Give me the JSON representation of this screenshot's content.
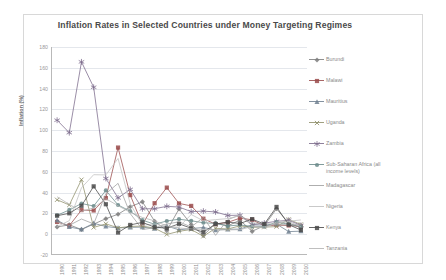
{
  "chart_data": {
    "type": "line",
    "title": "Inflation Rates in Selected Countries under Money Targeting Regimes",
    "xlabel": "",
    "ylabel": "Inflation (%)",
    "ylim": [
      -20,
      180
    ],
    "ytick_labels": [
      "180",
      "160",
      "140",
      "120",
      "100",
      "80",
      "60",
      "40",
      "20",
      "0",
      "-20"
    ],
    "ytick_values": [
      180,
      160,
      140,
      120,
      100,
      80,
      60,
      40,
      20,
      0,
      -20
    ],
    "grid": true,
    "legend_position": "right",
    "x": [
      1990,
      1991,
      1992,
      1993,
      1994,
      1995,
      1996,
      1997,
      1998,
      1999,
      2000,
      2001,
      2002,
      2003,
      2004,
      2005,
      2006,
      2007,
      2008,
      2009,
      2010
    ],
    "xtick_labels": [
      "1990",
      "1991",
      "1992",
      "1993",
      "1994",
      "1995",
      "1996",
      "1997",
      "1998",
      "1999",
      "2000",
      "2001",
      "2002",
      "2003",
      "2004",
      "2005",
      "2006",
      "2007",
      "2008",
      "2009",
      "2010"
    ],
    "series": [
      {
        "name": "Burundi",
        "color": "#7d7d7d",
        "marker": "diamond",
        "values": [
          7,
          9,
          4.5,
          9.7,
          14.9,
          19.2,
          26.4,
          31.1,
          12.5,
          3.4,
          24.3,
          9.3,
          -1.3,
          10.7,
          8.0,
          13.5,
          2.7,
          8.3,
          24.4,
          10.6,
          6.4
        ]
      },
      {
        "name": "Malawi",
        "color": "#9a4b4b",
        "marker": "square",
        "values": [
          11.8,
          8.2,
          23.2,
          22.8,
          34.7,
          83.3,
          37.6,
          9.1,
          29.8,
          44.8,
          29.6,
          27.2,
          14.9,
          9.6,
          11.4,
          15.4,
          13.9,
          7.9,
          8.7,
          8.4,
          7.4
        ]
      },
      {
        "name": "Mauritius",
        "color": "#6f7f8f",
        "marker": "triangle",
        "values": [
          13.5,
          7.0,
          4.6,
          10.5,
          7.4,
          6.0,
          6.6,
          6.8,
          5.4,
          7.9,
          4.2,
          5.4,
          6.5,
          3.9,
          4.7,
          4.9,
          8.9,
          8.8,
          9.7,
          2.5,
          2.9
        ]
      },
      {
        "name": "Uganda",
        "color": "#8f8f6a",
        "marker": "x",
        "values": [
          33.1,
          28.1,
          52.4,
          6.5,
          10.0,
          6.1,
          7.5,
          7.8,
          5.8,
          -0.2,
          2.8,
          4.5,
          -2.0,
          5.7,
          5.0,
          8.0,
          6.6,
          6.8,
          7.3,
          14.2,
          9.4
        ]
      },
      {
        "name": "Zambia",
        "color": "#7b6b8b",
        "marker": "star",
        "values": [
          109.6,
          97.6,
          165.7,
          141.3,
          53.6,
          34.9,
          43.1,
          24.4,
          24.5,
          26.8,
          26.1,
          21.7,
          22.2,
          21.4,
          18.0,
          18.3,
          9.0,
          10.7,
          12.4,
          13.4,
          8.5
        ]
      },
      {
        "name": "Sub-Saharan Africa (all\nincome levels)",
        "color": "#6b8b8b",
        "marker": "circle",
        "values": [
          18.2,
          23.3,
          29.5,
          27.1,
          42.1,
          28.1,
          22.1,
          13.5,
          9.6,
          12.7,
          14.4,
          12.9,
          11.0,
          10.4,
          7.9,
          8.9,
          7.5,
          7.1,
          11.7,
          9.6,
          7.2
        ]
      },
      {
        "name": "Madagascar",
        "color": "#a0a0a0",
        "marker": "none",
        "values": [
          11.8,
          8.5,
          14.6,
          9.9,
          38.9,
          48.9,
          19.8,
          4.5,
          6.2,
          9.8,
          11.9,
          6.9,
          16.2,
          -1.1,
          14.0,
          18.4,
          10.8,
          10.3,
          9.2,
          9.0,
          9.2
        ]
      },
      {
        "name": "Nigeria",
        "color": "#c0c0c0",
        "marker": "none",
        "values": [
          7.4,
          13.0,
          44.6,
          57.2,
          57.0,
          72.8,
          29.3,
          8.5,
          10.0,
          6.6,
          6.9,
          18.9,
          12.9,
          14.0,
          15.0,
          17.9,
          8.2,
          5.4,
          11.6,
          12.5,
          13.7
        ]
      },
      {
        "name": "Kenya",
        "color": "#4a4a4a",
        "marker": "square",
        "values": [
          17.8,
          20.1,
          27.3,
          46.0,
          28.8,
          1.6,
          8.9,
          11.4,
          6.7,
          5.8,
          10.0,
          5.7,
          2.0,
          9.8,
          11.6,
          10.3,
          14.5,
          9.8,
          26.2,
          9.2,
          4.0
        ]
      },
      {
        "name": "Tanzania",
        "color": "#b4b4b4",
        "marker": "none",
        "values": [
          36.0,
          28.7,
          21.9,
          25.3,
          34.1,
          27.4,
          21.0,
          16.1,
          12.8,
          7.9,
          5.9,
          5.1,
          4.6,
          4.4,
          4.1,
          4.4,
          7.3,
          7.0,
          10.3,
          12.1,
          7.2
        ]
      }
    ]
  }
}
